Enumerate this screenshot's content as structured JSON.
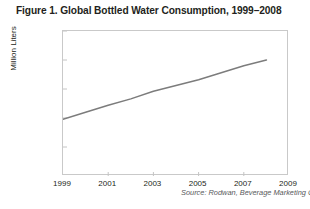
{
  "figure": {
    "title": "Figure 1. Global Bottled Water Consumption, 1999–2008",
    "source_note": "Source: Rodwan, Beverage Marketing Corporation"
  },
  "chart_data": {
    "type": "line",
    "title": "Figure 1. Global Bottled Water Consumption, 1999–2008",
    "xlabel": "",
    "ylabel": "Million Liters",
    "x": [
      1999,
      2000,
      2001,
      2002,
      2003,
      2004,
      2005,
      2006,
      2007,
      2008
    ],
    "series": [
      {
        "name": "Global bottled water consumption",
        "values": [
          98000,
          110000,
          122000,
          133000,
          146000,
          156000,
          166000,
          178000,
          190000,
          200000
        ]
      }
    ],
    "xlim": [
      1999,
      2009
    ],
    "ylim": [
      0,
      250000
    ],
    "xticks": [
      1999,
      2001,
      2003,
      2005,
      2007,
      2009
    ],
    "xtick_labels": [
      "1999",
      "2001",
      "2003",
      "2005",
      "2007",
      "2009"
    ],
    "yticks": [
      0,
      50000,
      100000,
      150000,
      200000,
      250000
    ],
    "ytick_labels": [
      "0",
      "50,000",
      "100,000",
      "150,000",
      "200,000",
      "250,000"
    ],
    "grid": false,
    "legend": null,
    "line_color": "#7c7c7c",
    "frame_color": "#c9c9c9",
    "annotations": [
      "Source: Rodwan, Beverage Marketing Corporation"
    ]
  }
}
